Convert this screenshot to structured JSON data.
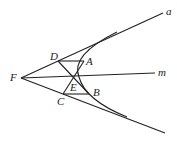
{
  "diagram": {
    "type": "geometry",
    "points": {
      "F": {
        "label": "F",
        "x": 21,
        "y": 78
      },
      "D": {
        "label": "D",
        "x": 58,
        "y": 61
      },
      "A": {
        "label": "A",
        "x": 84,
        "y": 61
      },
      "E": {
        "label": "E",
        "x": 74,
        "y": 78
      },
      "C": {
        "label": "C",
        "x": 63,
        "y": 94
      },
      "B": {
        "label": "B",
        "x": 89,
        "y": 94
      }
    },
    "lines": {
      "a": {
        "label": "a"
      },
      "m": {
        "label": "m"
      }
    },
    "stroke_color": "#222222"
  }
}
